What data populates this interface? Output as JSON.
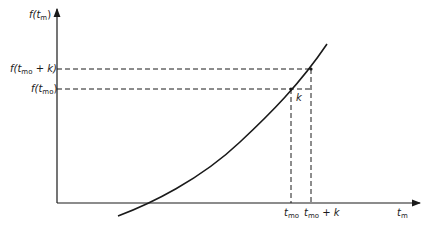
{
  "diagram": {
    "type": "function-plot",
    "y_axis_label": {
      "base": "f(t",
      "sub": "m",
      "tail": ")"
    },
    "x_axis_label": {
      "base": "t",
      "sub": "m"
    },
    "y_ticks": [
      {
        "base": "f(t",
        "sub": "mo",
        "tail": " + k)"
      },
      {
        "base": "f(t",
        "sub": "mo",
        "tail": ")"
      }
    ],
    "x_ticks": [
      {
        "base": "t",
        "sub": "mo",
        "tail": ""
      },
      {
        "base": "t",
        "sub": "mo",
        "tail": " + k"
      }
    ],
    "increment_label": "k",
    "colors": {
      "line": "#1a1a1a",
      "background": "#ffffff"
    }
  }
}
